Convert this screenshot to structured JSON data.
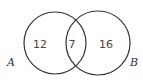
{
  "diagram": {
    "type": "venn",
    "sets": [
      {
        "label": "A",
        "only_count": "12"
      },
      {
        "label": "B",
        "only_count": "16"
      }
    ],
    "intersection_count": "7",
    "stroke_color": "#333333"
  }
}
